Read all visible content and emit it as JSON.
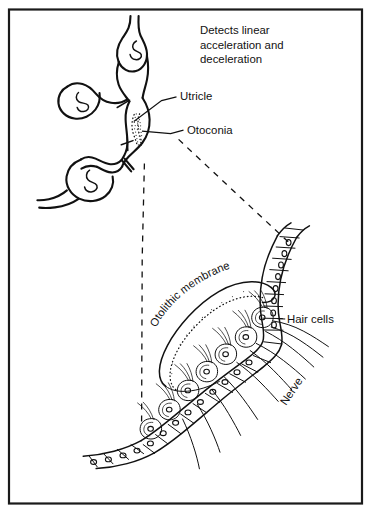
{
  "figure": {
    "caption_lines": [
      "Detects linear",
      "acceleration and",
      "deceleration"
    ],
    "caption_text": "Detects linear acceleration and deceleration"
  },
  "labels": {
    "utricle": "Utricle",
    "otoconia": "Otoconia",
    "otolithic_membrane": "Otolithic membrane",
    "hair_cells": "Hair cells",
    "nerve": "Nerve"
  },
  "footer": {
    "fragment": ""
  },
  "colors": {
    "ink": "#111111",
    "frame": "#1a1a1a",
    "background": "#ffffff",
    "stipple": "#3a3a3a"
  },
  "diagram": {
    "type": "anatomical-line-drawing",
    "panels": [
      {
        "name": "membranous-labyrinth",
        "description": "Membranous labyrinth with three ampullae and the utricle containing a stippled macula"
      },
      {
        "name": "macula-detail",
        "description": "Magnified macula: otolithic membrane with otoconia, hair cells, supporting cells and nerve fibers"
      }
    ],
    "magnification_leaders": 2
  }
}
